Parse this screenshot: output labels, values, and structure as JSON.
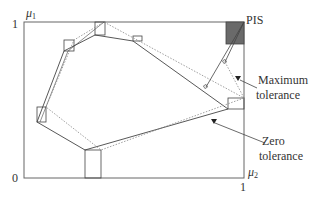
{
  "axes": {
    "y_label": "μ",
    "y_label_sub": "1",
    "x_label": "μ",
    "x_label_sub": "2",
    "y_tick_top": "1",
    "origin": "0",
    "x_tick_right": "1"
  },
  "labels": {
    "pis": "PIS",
    "max_tol_line1": "Maximum",
    "max_tol_line2": "tolerance",
    "zero_tol_line1": "Zero",
    "zero_tol_line2": "tolerance"
  },
  "colors": {
    "frame": "#555555",
    "line": "#444444",
    "dotted": "#888888",
    "pis_fill": "#666666"
  }
}
